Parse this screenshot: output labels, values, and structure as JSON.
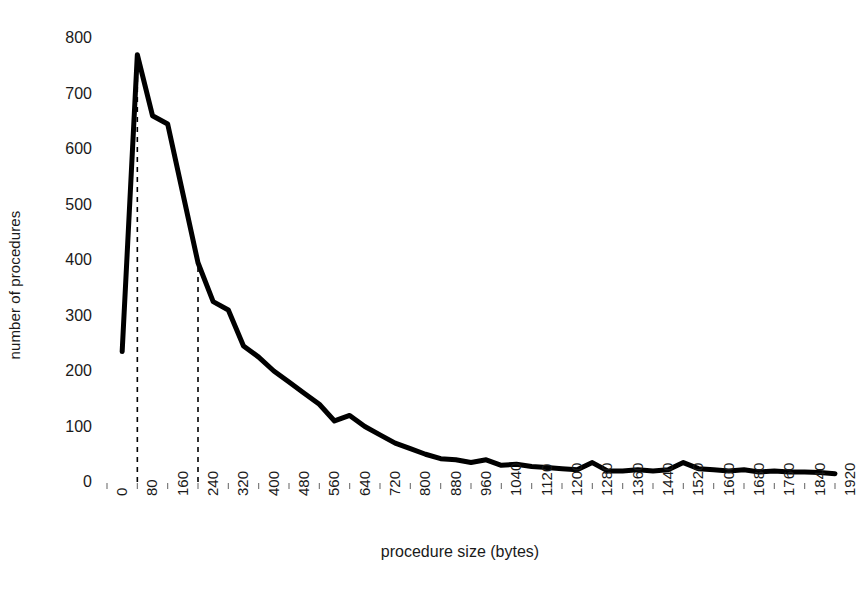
{
  "chart_data": {
    "type": "line",
    "title": "",
    "xlabel": "procedure size (bytes)",
    "ylabel": "number of procedures",
    "xlim": [
      0,
      1920
    ],
    "ylim": [
      0,
      800
    ],
    "grid": false,
    "legend": "none",
    "y_ticks": [
      0,
      100,
      200,
      300,
      400,
      500,
      600,
      700,
      800
    ],
    "x_ticks": [
      0,
      80,
      160,
      240,
      320,
      400,
      480,
      560,
      640,
      720,
      800,
      880,
      960,
      1040,
      1120,
      1200,
      1280,
      1360,
      1440,
      1520,
      1600,
      1680,
      1760,
      1840,
      1920
    ],
    "x": [
      40,
      80,
      120,
      160,
      200,
      240,
      280,
      320,
      360,
      400,
      440,
      480,
      520,
      560,
      600,
      640,
      680,
      720,
      760,
      800,
      840,
      880,
      920,
      960,
      1000,
      1040,
      1080,
      1120,
      1160,
      1200,
      1240,
      1280,
      1320,
      1360,
      1400,
      1440,
      1480,
      1520,
      1560,
      1600,
      1640,
      1680,
      1720,
      1760,
      1800,
      1840,
      1880,
      1920
    ],
    "values": [
      235,
      770,
      660,
      645,
      520,
      395,
      325,
      310,
      245,
      225,
      200,
      180,
      160,
      140,
      110,
      120,
      100,
      85,
      70,
      60,
      50,
      42,
      40,
      35,
      40,
      30,
      32,
      28,
      26,
      24,
      22,
      35,
      20,
      20,
      22,
      20,
      22,
      35,
      24,
      22,
      20,
      22,
      18,
      20,
      18,
      18,
      17,
      15
    ],
    "annotations": [
      {
        "name": "peak-guide",
        "type": "dashed-vertical",
        "x": 80,
        "y_from": 0,
        "y_to": 770
      },
      {
        "name": "knee-guide",
        "type": "dashed-vertical",
        "x": 240,
        "y_from": 0,
        "y_to": 395
      }
    ],
    "series_color": "#000000",
    "line_width": 5
  },
  "axes": {
    "y_title": "number of procedures",
    "x_title": "procedure size (bytes)",
    "y_tick_labels": [
      "800",
      "700",
      "600",
      "500",
      "400",
      "300",
      "200",
      "100",
      "0"
    ],
    "x_tick_labels": [
      "0",
      "80",
      "160",
      "240",
      "320",
      "400",
      "480",
      "560",
      "640",
      "720",
      "800",
      "880",
      "960",
      "1040",
      "1120",
      "1200",
      "1280",
      "1360",
      "1440",
      "1520",
      "1600",
      "1680",
      "1760",
      "1840",
      "1920"
    ]
  },
  "colors": {
    "background": "#ffffff",
    "ink": "#000000",
    "text": "#1a1a1a"
  }
}
